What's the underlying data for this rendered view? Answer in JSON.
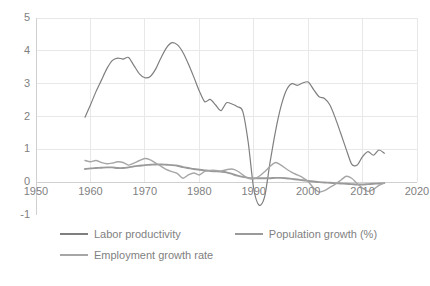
{
  "chart_data": {
    "type": "line",
    "title": "",
    "xlabel": "",
    "ylabel": "",
    "xlim": [
      1950,
      2020
    ],
    "ylim": [
      -1,
      5
    ],
    "xticks": [
      1950,
      1960,
      1970,
      1980,
      1990,
      2000,
      2010,
      2020
    ],
    "yticks": [
      -1,
      0,
      1,
      2,
      3,
      4,
      5
    ],
    "grid": true,
    "legend_position": "bottom",
    "colors": {
      "labor_productivity": "#7f7f7f",
      "population_growth": "#9a9a9a",
      "employment_growth": "#a6a6a6",
      "gridline": "#e8e8e8",
      "axis": "#d0d0d0",
      "text": "#7f7f7f"
    },
    "x": [
      1959,
      1960,
      1961,
      1962,
      1963,
      1964,
      1965,
      1966,
      1967,
      1968,
      1969,
      1970,
      1971,
      1972,
      1973,
      1974,
      1975,
      1976,
      1977,
      1978,
      1979,
      1980,
      1981,
      1982,
      1983,
      1984,
      1985,
      1986,
      1987,
      1988,
      1989,
      1990,
      1991,
      1992,
      1993,
      1994,
      1995,
      1996,
      1997,
      1998,
      1999,
      2000,
      2001,
      2002,
      2003,
      2004,
      2005,
      2006,
      2007,
      2008,
      2009,
      2010,
      2011,
      2012,
      2013,
      2014
    ],
    "series": [
      {
        "name": "Labor productivity",
        "values": [
          1.98,
          2.35,
          2.75,
          3.1,
          3.45,
          3.7,
          3.78,
          3.75,
          3.8,
          3.55,
          3.3,
          3.18,
          3.22,
          3.45,
          3.8,
          4.1,
          4.25,
          4.18,
          3.95,
          3.6,
          3.2,
          2.78,
          2.45,
          2.52,
          2.35,
          2.18,
          2.42,
          2.38,
          2.3,
          2.15,
          1.2,
          -0.2,
          -0.7,
          -0.45,
          0.6,
          1.55,
          2.3,
          2.8,
          3.0,
          2.95,
          3.02,
          3.05,
          2.82,
          2.6,
          2.55,
          2.35,
          1.95,
          1.48,
          1.0,
          0.55,
          0.52,
          0.78,
          0.93,
          0.82,
          0.98,
          0.88
        ]
      },
      {
        "name": "Population growth (%)",
        "values": [
          0.4,
          0.42,
          0.43,
          0.44,
          0.45,
          0.45,
          0.43,
          0.43,
          0.45,
          0.48,
          0.5,
          0.52,
          0.53,
          0.54,
          0.54,
          0.53,
          0.52,
          0.5,
          0.46,
          0.43,
          0.4,
          0.38,
          0.36,
          0.34,
          0.33,
          0.32,
          0.3,
          0.25,
          0.2,
          0.16,
          0.13,
          0.12,
          0.12,
          0.12,
          0.12,
          0.13,
          0.13,
          0.12,
          0.1,
          0.08,
          0.06,
          0.04,
          0.02,
          0.0,
          -0.01,
          -0.02,
          -0.03,
          -0.04,
          -0.05,
          -0.06,
          -0.07,
          -0.07,
          -0.06,
          -0.05,
          -0.04,
          -0.03
        ]
      },
      {
        "name": "Employment growth rate",
        "values": [
          0.66,
          0.62,
          0.66,
          0.6,
          0.56,
          0.58,
          0.62,
          0.6,
          0.52,
          0.58,
          0.66,
          0.72,
          0.68,
          0.58,
          0.48,
          0.38,
          0.32,
          0.26,
          0.12,
          0.22,
          0.28,
          0.22,
          0.33,
          0.36,
          0.36,
          0.34,
          0.38,
          0.4,
          0.34,
          0.22,
          0.12,
          0.1,
          0.18,
          0.32,
          0.48,
          0.6,
          0.52,
          0.4,
          0.3,
          0.22,
          0.14,
          0.02,
          -0.18,
          -0.3,
          -0.26,
          -0.16,
          -0.06,
          0.06,
          0.18,
          0.12,
          -0.04,
          -0.18,
          -0.28,
          -0.22,
          -0.1,
          -0.02
        ]
      }
    ]
  },
  "legend": {
    "items": [
      {
        "label": "Labor productivity",
        "color": "#7f7f7f"
      },
      {
        "label": "Population growth (%)",
        "color": "#9a9a9a"
      },
      {
        "label": "Employment growth rate",
        "color": "#a6a6a6"
      }
    ]
  },
  "axes": {
    "y_tick_labels": [
      "5",
      "4",
      "3",
      "2",
      "1",
      "0",
      "-1"
    ],
    "x_tick_labels": [
      "1950",
      "1960",
      "1970",
      "1980",
      "1990",
      "2000",
      "2010",
      "2020"
    ]
  }
}
